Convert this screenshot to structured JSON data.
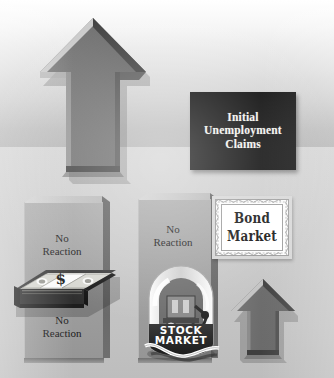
{
  "illustration": {
    "title": "Initial Unemployment Claims market reaction diagram",
    "palette": {
      "arrow_fill": "#6e6e6e",
      "arrow_bevel_light": "#c8c8c8",
      "arrow_bevel_dark": "#4a4a4a",
      "sign_background": "#070707",
      "sign_text": "#f2f2ee",
      "block_face": "#a3a3a3",
      "block_side": "#5d5d5d",
      "wall_top": "#ffffff",
      "wall_bottom": "#b2b2b2",
      "floor": "#c7c7c7"
    }
  },
  "sign": {
    "line1": "Initial",
    "line2": "Unemployment",
    "line3": "Claims"
  },
  "arrows": {
    "primary": {
      "name": "large-up-arrow",
      "direction": "up",
      "meaning": "Initial Unemployment Claims rise"
    },
    "secondary": {
      "name": "small-up-arrow",
      "direction": "up",
      "meaning": "Bond Market rises"
    }
  },
  "blocks": [
    {
      "id": "block-dollar",
      "label_top": "No\nReaction",
      "label_top_line1": "No",
      "label_top_line2": "Reaction",
      "label_bottom_line1": "No",
      "label_bottom_line2": "Reaction",
      "subject": "dollar / currency"
    },
    {
      "id": "block-stock",
      "label_top_line1": "No",
      "label_top_line2": "Reaction",
      "subject": "stock market"
    }
  ],
  "money": {
    "name": "stack-of-banknotes",
    "band_symbol": "$"
  },
  "stock_jar": {
    "name": "stock-market-bell-jar",
    "label_line1": "STOCK",
    "label_line2": "MARKET"
  },
  "certificate": {
    "name": "bond-market-certificate",
    "line1": "Bond",
    "line2": "Market"
  }
}
